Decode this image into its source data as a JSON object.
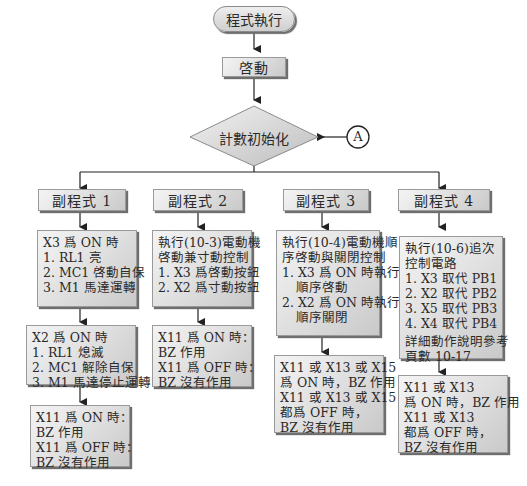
{
  "flowchart": {
    "start": "程式執行",
    "init": "啓動",
    "decision": "計數初始化",
    "connector": "A",
    "columns": [
      {
        "title": "副程式 1",
        "blocks": [
          [
            "X3 爲 ON 時",
            "1. RL1 亮",
            "2. MC1 啓動自保",
            "3. M1 馬達運轉"
          ],
          [
            "X2 爲 ON 時",
            "1. RL1 熄滅",
            "2. MC1 解除自保",
            "3. M1 馬達停止運轉"
          ],
          [
            "X11 爲 ON 時：",
            "BZ 作用",
            "X11 爲 OFF 時：",
            "BZ 沒有作用"
          ]
        ]
      },
      {
        "title": "副程式 2",
        "blocks": [
          [
            "執行(10-3)電動機",
            "啓動兼寸動控制",
            "1. X3 爲啓動按鈕",
            "2. X2 爲寸動按鈕"
          ],
          [
            "X11 爲 ON 時：",
            "BZ 作用",
            "X11 爲 OFF 時：",
            "BZ 沒有作用"
          ]
        ]
      },
      {
        "title": "副程式 3",
        "blocks": [
          [
            "執行(10-4)電動機順",
            "序啓動與關閉控制",
            "1. X3 爲 ON 時執行",
            "順序啓動",
            "2. X2 爲 ON 時執行",
            "順序關閉"
          ],
          [
            "X11 或 X13 或 X15",
            "爲 ON 時，BZ 作用",
            "X11 或 X13 或 X15",
            "都爲 OFF 時，",
            "BZ 沒有作用"
          ]
        ]
      },
      {
        "title": "副程式 4",
        "blocks": [
          [
            "執行(10-6)追次",
            "控制電路",
            "1. X3 取代 PB1",
            "2. X2 取代 PB2",
            "3. X5 取代 PB3",
            "4. X4 取代 PB4",
            "詳細動作說明參考",
            "頁數 10-17"
          ],
          [
            "X11 或 X13",
            "爲 ON 時，BZ 作用",
            "X11 或 X13",
            "都爲 OFF 時，",
            "BZ 沒有作用"
          ]
        ]
      }
    ]
  }
}
